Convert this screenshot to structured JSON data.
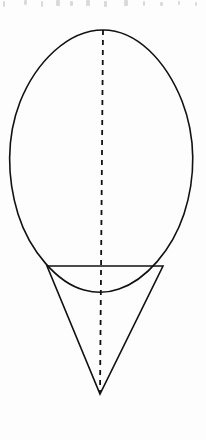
{
  "page": {
    "width": 206,
    "height": 440,
    "background_color": "#fdfdfd",
    "title": "Geometric figure: oval above inverted triangle with dashed axis of symmetry",
    "media": "scanned line drawing"
  },
  "style": {
    "stroke_color": "#111111",
    "stroke_width": 1.6,
    "dashed_stroke_color": "#111111",
    "dashed_stroke_width": 1.8,
    "dash_pattern": "5 5",
    "artifact_color": "#bdbdbd"
  },
  "figure": {
    "name": "oval-over-triangle-diagram",
    "shapes": [
      {
        "id": "oval",
        "name": "egg-oval-outline",
        "type": "closed-curve",
        "label": "Oval",
        "filled": false,
        "apex": {
          "x": 103,
          "y": 30
        },
        "bottom": {
          "x": 100,
          "y": 291
        },
        "left_extreme": {
          "x": 10,
          "y": 128
        },
        "right_extreme": {
          "x": 195,
          "y": 126
        },
        "path": "M 103 30 C 68 30 36 62 20 102 C 6 138 7 178 18 214 C 30 252 58 283 84 290 C 95 293 108 293 119 289 C 146 280 172 250 184 214 C 196 177 196 137 182 101 C 166 61 137 30 103 30 Z"
      },
      {
        "id": "triangle",
        "name": "inverted-triangle-outline",
        "type": "polygon",
        "label": "Inverted triangle",
        "filled": false,
        "vertices": [
          {
            "id": "top-left",
            "x": 47,
            "y": 266
          },
          {
            "id": "top-right",
            "x": 163,
            "y": 266
          },
          {
            "id": "apex",
            "x": 100,
            "y": 394
          }
        ],
        "path": "M 47 266 L 163 266 L 100 394 Z"
      },
      {
        "id": "axis",
        "name": "dashed-axis-of-symmetry",
        "type": "dashed-line",
        "label": "Axis of symmetry",
        "start": {
          "x": 103,
          "y": 30
        },
        "end": {
          "x": 100,
          "y": 394
        },
        "path": "M 103 30 L 100 394"
      }
    ],
    "intersections": [
      {
        "name": "oval-triangle-left",
        "x": 62,
        "y": 282
      },
      {
        "name": "oval-triangle-right",
        "x": 148,
        "y": 282
      }
    ]
  },
  "artifacts": {
    "name": "top-edge-scan-artifacts",
    "description": "faint cut-off descenders from the line of text above",
    "marks": [
      {
        "x": 3,
        "y": 1,
        "w": 2,
        "h": 6
      },
      {
        "x": 24,
        "y": 0,
        "w": 3,
        "h": 5
      },
      {
        "x": 41,
        "y": 1,
        "w": 2,
        "h": 6
      },
      {
        "x": 56,
        "y": 0,
        "w": 4,
        "h": 6
      },
      {
        "x": 70,
        "y": 1,
        "w": 3,
        "h": 5
      },
      {
        "x": 86,
        "y": 0,
        "w": 4,
        "h": 6
      },
      {
        "x": 104,
        "y": 1,
        "w": 3,
        "h": 6
      },
      {
        "x": 124,
        "y": 0,
        "w": 4,
        "h": 6
      },
      {
        "x": 143,
        "y": 1,
        "w": 2,
        "h": 5
      },
      {
        "x": 160,
        "y": 2,
        "w": 3,
        "h": 4
      },
      {
        "x": 178,
        "y": 1,
        "w": 2,
        "h": 4
      },
      {
        "x": 195,
        "y": 2,
        "w": 2,
        "h": 4
      }
    ]
  },
  "caption": {
    "text": ""
  }
}
